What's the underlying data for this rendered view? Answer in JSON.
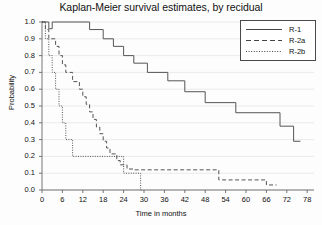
{
  "chart_data": {
    "type": "line",
    "title": "Kaplan-Meier survival estimates, by recidual",
    "xlabel": "Time in months",
    "ylabel": "Probability",
    "xlim": [
      0,
      80
    ],
    "ylim": [
      0,
      1.0
    ],
    "grid": true,
    "legend_position": "top-right",
    "xticks": [
      "0",
      "6",
      "12",
      "18",
      "24",
      "30",
      "36",
      "42",
      "48",
      "54",
      "60",
      "66",
      "72",
      "78"
    ],
    "xtick_values": [
      0,
      6,
      12,
      18,
      24,
      30,
      36,
      42,
      48,
      54,
      60,
      66,
      72,
      78
    ],
    "yticks": [
      "0.0",
      "0.1",
      "0.2",
      "0.3",
      "0.4",
      "0.5",
      "0.6",
      "0.7",
      "0.8",
      "0.9",
      "1.0"
    ],
    "ytick_values": [
      0.0,
      0.1,
      0.2,
      0.3,
      0.4,
      0.5,
      0.6,
      0.7,
      0.8,
      0.9,
      1.0
    ],
    "series": [
      {
        "name": "R-1",
        "style": "solid",
        "color": "#555555",
        "points": [
          [
            0,
            1.0
          ],
          [
            2,
            1.0
          ],
          [
            2,
            0.96
          ],
          [
            3,
            0.96
          ],
          [
            3,
            1.0
          ],
          [
            14,
            1.0
          ],
          [
            14,
            0.955
          ],
          [
            18,
            0.955
          ],
          [
            18,
            0.9
          ],
          [
            21,
            0.9
          ],
          [
            21,
            0.855
          ],
          [
            24,
            0.855
          ],
          [
            24,
            0.8
          ],
          [
            27,
            0.8
          ],
          [
            27,
            0.755
          ],
          [
            31,
            0.755
          ],
          [
            31,
            0.7
          ],
          [
            37,
            0.7
          ],
          [
            37,
            0.65
          ],
          [
            42,
            0.65
          ],
          [
            42,
            0.585
          ],
          [
            48,
            0.585
          ],
          [
            48,
            0.52
          ],
          [
            57,
            0.52
          ],
          [
            57,
            0.46
          ],
          [
            70,
            0.46
          ],
          [
            70,
            0.38
          ],
          [
            74,
            0.38
          ],
          [
            74,
            0.29
          ],
          [
            76,
            0.29
          ]
        ]
      },
      {
        "name": "R-2a",
        "style": "dashed",
        "color": "#555555",
        "points": [
          [
            0,
            1.0
          ],
          [
            1,
            1.0
          ],
          [
            1,
            0.955
          ],
          [
            2,
            0.955
          ],
          [
            2,
            0.9
          ],
          [
            4,
            0.9
          ],
          [
            4,
            0.855
          ],
          [
            5,
            0.855
          ],
          [
            5,
            0.8
          ],
          [
            6,
            0.8
          ],
          [
            6,
            0.745
          ],
          [
            7,
            0.745
          ],
          [
            7,
            0.7
          ],
          [
            9,
            0.7
          ],
          [
            9,
            0.645
          ],
          [
            11,
            0.645
          ],
          [
            11,
            0.6
          ],
          [
            12,
            0.6
          ],
          [
            12,
            0.555
          ],
          [
            13,
            0.555
          ],
          [
            13,
            0.51
          ],
          [
            14,
            0.51
          ],
          [
            14,
            0.465
          ],
          [
            15,
            0.465
          ],
          [
            15,
            0.42
          ],
          [
            16,
            0.42
          ],
          [
            16,
            0.375
          ],
          [
            17,
            0.375
          ],
          [
            17,
            0.335
          ],
          [
            18,
            0.335
          ],
          [
            18,
            0.29
          ],
          [
            19,
            0.29
          ],
          [
            19,
            0.25
          ],
          [
            20,
            0.25
          ],
          [
            20,
            0.215
          ],
          [
            22,
            0.215
          ],
          [
            22,
            0.175
          ],
          [
            23,
            0.175
          ],
          [
            23,
            0.15
          ],
          [
            25,
            0.15
          ],
          [
            25,
            0.125
          ],
          [
            27,
            0.125
          ],
          [
            27,
            0.12
          ],
          [
            52,
            0.12
          ],
          [
            52,
            0.06
          ],
          [
            66,
            0.06
          ],
          [
            66,
            0.03
          ],
          [
            69,
            0.03
          ]
        ]
      },
      {
        "name": "R-2b",
        "style": "dotted",
        "color": "#555555",
        "points": [
          [
            0,
            1.0
          ],
          [
            1,
            1.0
          ],
          [
            1,
            0.9
          ],
          [
            2,
            0.9
          ],
          [
            2,
            0.8
          ],
          [
            3,
            0.8
          ],
          [
            3,
            0.7
          ],
          [
            4,
            0.7
          ],
          [
            4,
            0.6
          ],
          [
            5,
            0.6
          ],
          [
            5,
            0.5
          ],
          [
            6,
            0.5
          ],
          [
            6,
            0.4
          ],
          [
            7,
            0.4
          ],
          [
            7,
            0.3
          ],
          [
            9,
            0.3
          ],
          [
            9,
            0.2
          ],
          [
            10,
            0.2
          ],
          [
            24,
            0.2
          ],
          [
            24,
            0.1
          ],
          [
            29,
            0.1
          ],
          [
            29,
            0.0
          ],
          [
            29.3,
            0.0
          ]
        ]
      }
    ]
  },
  "legend": {
    "items": [
      {
        "label": "R-1",
        "style": "solid"
      },
      {
        "label": "R-2a",
        "style": "dashed"
      },
      {
        "label": "R-2b",
        "style": "dotted"
      }
    ]
  }
}
